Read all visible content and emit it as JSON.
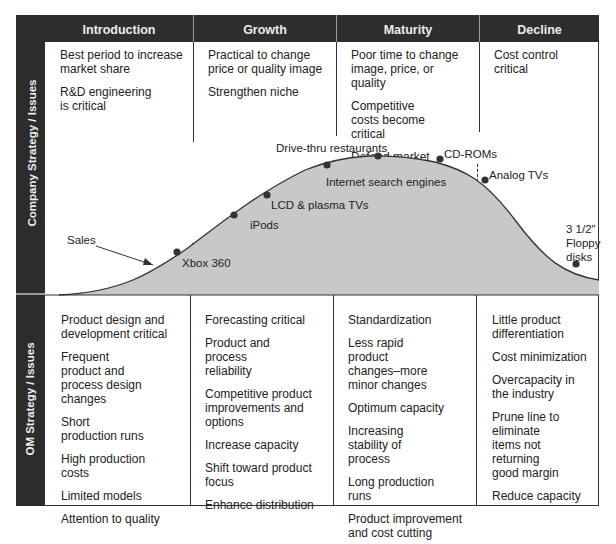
{
  "header": {
    "columns": [
      "Introduction",
      "Growth",
      "Maturity",
      "Decline"
    ]
  },
  "side_labels": {
    "top": "Company Strategy / Issues",
    "bottom": "OM Strategy / Issues"
  },
  "company_strategy": {
    "introduction": [
      "Best period to increase market share",
      "R&D engineering is critical"
    ],
    "growth": [
      "Practical to change price or quality image",
      "Strengthen niche"
    ],
    "maturity": [
      "Poor time to change image, price, or quality",
      "Competitive costs become critical",
      "Defend market position"
    ],
    "decline": [
      "Cost control critical"
    ]
  },
  "om_strategy": {
    "introduction": [
      "Product design and development critical",
      "Frequent product and process design changes",
      "Short production runs",
      "High production costs",
      "Limited models",
      "Attention to quality"
    ],
    "growth": [
      "Forecasting critical",
      "Product and process reliability",
      "Competitive product improvements and options",
      "Increase capacity",
      "Shift toward product focus",
      "Enhance distribution"
    ],
    "maturity": [
      "Standardization",
      "Less rapid product changes–more minor changes",
      "Optimum capacity",
      "Increasing stability of process",
      "Long production runs",
      "Product improvement and cost cutting"
    ],
    "decline": [
      "Little product differentiation",
      "Cost minimization",
      "Overcapacity in the industry",
      "Prune line to eliminate items not returning good margin",
      "Reduce capacity"
    ]
  },
  "curve": {
    "series_label": "Sales",
    "points": [
      {
        "label": "Xbox 360",
        "stage": "Introduction"
      },
      {
        "label": "iPods",
        "stage": "Growth"
      },
      {
        "label": "LCD & plasma TVs",
        "stage": "Growth"
      },
      {
        "label": "Internet search engines",
        "stage": "Growth/Maturity"
      },
      {
        "label": "Drive-thru restaurants",
        "stage": "Maturity"
      },
      {
        "label": "CD-ROMs",
        "stage": "Maturity"
      },
      {
        "label": "Analog TVs",
        "stage": "Decline"
      },
      {
        "label": "3 1/2\" Floppy disks",
        "stage": "Decline"
      }
    ],
    "floppy_lines": [
      "3 1/2\"",
      "Floppy",
      "disks"
    ]
  },
  "colors": {
    "header_bg": "#2e2e2e",
    "curve_fill": "#c8c8c8",
    "point": "#333333"
  }
}
